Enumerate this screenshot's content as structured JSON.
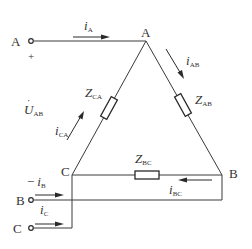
{
  "diagram": {
    "type": "delta-connected three-phase load",
    "nodes": {
      "A": "A",
      "B": "B",
      "C": "C"
    },
    "terminals": {
      "A": "A",
      "B": "B",
      "C": "C"
    },
    "polarity": {
      "plus": "+"
    },
    "impedances": {
      "AB": {
        "main": "Z",
        "sub": "AB"
      },
      "BC": {
        "main": "Z",
        "sub": "BC"
      },
      "CA": {
        "main": "Z",
        "sub": "CA"
      }
    },
    "line_currents": {
      "A": {
        "main": "i",
        "sub": "A"
      },
      "B": {
        "prefix": "−",
        "main": "i",
        "sub": "B"
      },
      "C": {
        "main": "i",
        "sub": "C"
      }
    },
    "phase_currents": {
      "AB": {
        "main": "i",
        "sub": "AB"
      },
      "BC": {
        "main": "i",
        "sub": "BC"
      },
      "CA": {
        "main": "i",
        "sub": "CA"
      }
    },
    "voltage": {
      "main": "U",
      "dot": "·",
      "sub": "AB"
    },
    "colors": {
      "line": "#3a3a3a",
      "text": "#333333",
      "background": "#ffffff"
    }
  }
}
